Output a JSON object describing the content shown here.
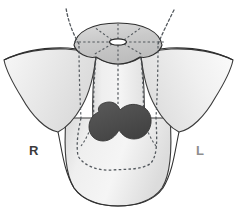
{
  "figure": {
    "background_color": "#ffffff"
  },
  "labels": {
    "right": {
      "text": "R",
      "meaning": "right side of the patient",
      "color": "#3b3b3b",
      "x": 29,
      "y": 144
    },
    "left": {
      "text": "L",
      "meaning": "left side of the patient",
      "color": "#8e8e8e",
      "x": 196,
      "y": 144
    }
  },
  "colors": {
    "outline_dark": "#2f2f2f",
    "outline_mid": "#4a4a4a",
    "dotted_line": "#53585d",
    "lesion_fill": "#4f4f4f",
    "lesion_stroke": "#3a3a3a",
    "body_fill_light": "#f1f1f1",
    "body_fill_mid": "#dcdcdc",
    "wing_fill": "#e9e9e9",
    "dome_fill": "#cfcfcf",
    "aperture_fill": "#ffffff",
    "background": "#ffffff"
  },
  "structures": {
    "dome_cap": {
      "name": "superior dome cap",
      "fill": "#cfcfcf",
      "center_x": 118,
      "center_y": 46
    },
    "central_aperture": {
      "name": "central aperture",
      "shape": "ellipse",
      "fill": "#ffffff",
      "cx": 118,
      "cy": 42,
      "rx": 8,
      "ry": 3
    },
    "left_wing": {
      "name": "patient-right wing",
      "fill": "#e9e9e9"
    },
    "right_wing": {
      "name": "patient-left wing",
      "fill": "#e9e9e9"
    },
    "central_body": {
      "name": "central body column",
      "fill": "#efefef"
    },
    "lower_body": {
      "name": "inferior rounded body",
      "fill": "#ededed"
    },
    "lesion": {
      "name": "central dark mass",
      "fill": "#4f4f4f",
      "stroke": "#3a3a3a",
      "bounds": {
        "x": 94,
        "y": 102,
        "width": 58,
        "height": 40
      }
    }
  },
  "dotted_guides": {
    "vertical_lines_x": [
      81,
      95,
      118,
      141,
      155
    ],
    "horizontal_line_y": 42,
    "horizontal_line_x_start": 74,
    "horizontal_line_x_end": 164,
    "radial_spoke_count": 8,
    "upper_projection_left": "curved dotted line rising off the top edge",
    "upper_projection_right": "straight dotted line rising off the top edge",
    "lower_contour": "dotted outline of the deep body contour"
  }
}
